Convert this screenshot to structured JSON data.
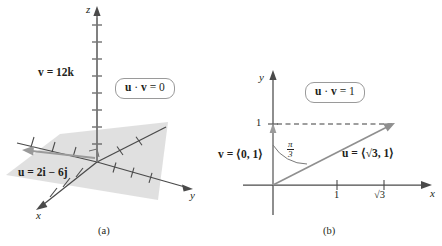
{
  "figure": {
    "type": "math-vector-diagram",
    "panels": [
      {
        "caption": "(a)",
        "kind": "3d-axes",
        "axes": {
          "x_label": "x",
          "y_label": "y",
          "z_label": "z"
        },
        "annotations": {
          "vector_v": "v = 12k",
          "vector_u": "u = 2i − 6j",
          "boxed_result": "u · v = 0"
        },
        "boxed_parts": {
          "u": "u",
          "dot": "·",
          "v": "v",
          "rhs": "= 0"
        },
        "right_angle_marker": true,
        "plane_shaded": true,
        "colors": {
          "axis": "#3f3f3f",
          "vector": "#8c8c8c",
          "plane": "#dcdcdc",
          "box_border": "#9a9a9a"
        }
      },
      {
        "caption": "(b)",
        "kind": "2d-axes",
        "axes": {
          "x_label": "x",
          "y_label": "y"
        },
        "x_ticks": [
          {
            "value": 1,
            "label": "1"
          },
          {
            "value": 1.732,
            "label": "√3"
          }
        ],
        "y_ticks": [
          {
            "value": 1,
            "label": "1"
          }
        ],
        "annotations": {
          "vector_v": "v = ⟨0, 1⟩",
          "vector_u": "u = ⟨√3, 1⟩",
          "angle": "π/3",
          "angle_numerator": "π",
          "angle_denominator": "3",
          "boxed_result": "u · v = 1"
        },
        "boxed_parts": {
          "u": "u",
          "dot": "·",
          "v": "v",
          "rhs": "= 1"
        },
        "vector_u_parts": {
          "name": "u",
          "equals": "= ⟨",
          "radical": "√",
          "radicand": "3",
          "rest": ", 1⟩"
        },
        "vector_v_parts": {
          "name": "v",
          "rest": "= ⟨0, 1⟩"
        },
        "dashed_guide": true,
        "colors": {
          "axis": "#3f3f3f",
          "vector": "#8c8c8c",
          "dashed": "#3f3f3f",
          "box_border": "#9a9a9a"
        }
      }
    ]
  }
}
